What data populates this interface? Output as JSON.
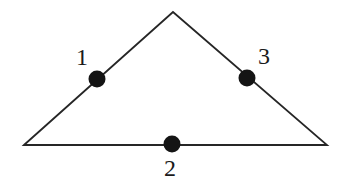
{
  "figure": {
    "type": "geometry-diagram",
    "background_color": "#ffffff",
    "stroke_color": "#262626",
    "stroke_width": 1.8,
    "dot_color": "#141414",
    "label_color": "#1a1a1a",
    "canvas": {
      "width": 343,
      "height": 190
    },
    "vertices": [
      {
        "name": "left-vertex",
        "x": 24,
        "y": 145
      },
      {
        "name": "apex-vertex",
        "x": 173,
        "y": 12
      },
      {
        "name": "right-vertex",
        "x": 327,
        "y": 145
      }
    ],
    "edges": [
      {
        "name": "left-edge",
        "from": "left-vertex",
        "to": "apex-vertex"
      },
      {
        "name": "right-edge",
        "from": "apex-vertex",
        "to": "right-vertex"
      },
      {
        "name": "base-edge",
        "from": "right-vertex",
        "to": "left-vertex"
      }
    ],
    "points": [
      {
        "id": "point-1",
        "label": "1",
        "on_edge": "left-edge",
        "cx": 97,
        "cy": 79,
        "r": 8.5,
        "label_x": 76,
        "label_y": 45
      },
      {
        "id": "point-2",
        "label": "2",
        "on_edge": "base-edge",
        "cx": 172,
        "cy": 144,
        "r": 8.5,
        "label_x": 164,
        "label_y": 156
      },
      {
        "id": "point-3",
        "label": "3",
        "on_edge": "right-edge",
        "cx": 247,
        "cy": 78,
        "r": 8.5,
        "label_x": 258,
        "label_y": 44
      }
    ]
  }
}
